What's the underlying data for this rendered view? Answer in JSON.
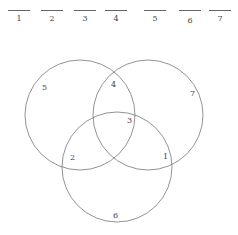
{
  "answer_blanks": [
    {
      "label": "1",
      "x": 8
    },
    {
      "label": "2",
      "x": 41
    },
    {
      "label": "3",
      "x": 74
    },
    {
      "label": "4",
      "x": 105
    },
    {
      "label": "5",
      "x": 144
    },
    {
      "label": "6",
      "x": 179
    },
    {
      "label": "7",
      "x": 209
    }
  ],
  "venn": {
    "circles": [
      {
        "name": "left",
        "cx": 80,
        "cy": 115,
        "r": 55
      },
      {
        "name": "right",
        "cx": 148,
        "cy": 115,
        "r": 55
      },
      {
        "name": "bottom",
        "cx": 117,
        "cy": 167,
        "r": 55
      }
    ],
    "regions": [
      {
        "label": "5",
        "x": 45,
        "y": 90
      },
      {
        "label": "4",
        "x": 114,
        "y": 87
      },
      {
        "label": "7",
        "x": 193,
        "y": 96
      },
      {
        "label": "3",
        "x": 129,
        "y": 123
      },
      {
        "label": "2",
        "x": 72,
        "y": 160
      },
      {
        "label": "1",
        "x": 165,
        "y": 159
      },
      {
        "label": "6",
        "x": 115,
        "y": 218
      }
    ],
    "stroke_color": "#777777"
  }
}
